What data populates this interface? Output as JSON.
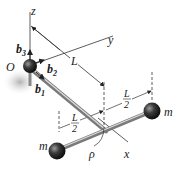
{
  "diagram": {
    "type": "rigid-body-mechanics",
    "labels": {
      "origin": "O",
      "axis_z": "z",
      "axis_y": "y",
      "axis_x": "x",
      "b1": "b",
      "b1_sub": "1",
      "b2": "b",
      "b2_sub": "2",
      "b3": "b",
      "b3_sub": "3",
      "length_L": "L",
      "half_L_num_left": "L",
      "half_L_den_left": "2",
      "half_L_num_right": "L",
      "half_L_den_right": "2",
      "mass_left": "m",
      "mass_right": "m",
      "angle": "ρ"
    },
    "colors": {
      "line": "#333333",
      "rod": "#9a9a9a",
      "rod_highlight": "#d8d8d8",
      "sphere": "#2a2a2a",
      "shadow": "#bdbdbd"
    }
  }
}
